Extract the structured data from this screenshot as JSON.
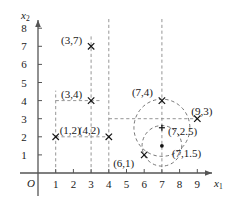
{
  "chart_data": {
    "type": "scatter",
    "title": "",
    "xlabel": "x1",
    "ylabel": "x2",
    "xlim": [
      0,
      9.9
    ],
    "ylim": [
      0,
      8.7
    ],
    "grid": "dashed-guides",
    "legend": "none",
    "axis_labels": {
      "x": "x",
      "x_sub": "1",
      "y": "x",
      "y_sub": "2",
      "origin": "O"
    },
    "xticks": [
      "1",
      "2",
      "3",
      "4",
      "5",
      "6",
      "7",
      "8",
      "9"
    ],
    "xtick_values": [
      1,
      2,
      3,
      4,
      5,
      6,
      7,
      8,
      9
    ],
    "yticks": [
      "1",
      "2",
      "3",
      "4",
      "5",
      "6",
      "7",
      "8"
    ],
    "ytick_values": [
      1,
      2,
      3,
      4,
      5,
      6,
      7,
      8
    ],
    "points": [
      {
        "id": "p37",
        "label": "(3,7)",
        "x": 3,
        "y": 7,
        "marker": "cross",
        "label_dx": -30,
        "label_dy": -11
      },
      {
        "id": "p34",
        "label": "(3,4)",
        "x": 3,
        "y": 4,
        "marker": "cross",
        "label_dx": -30,
        "label_dy": -12
      },
      {
        "id": "p12",
        "label": "(1,2)",
        "x": 1,
        "y": 2,
        "marker": "cross",
        "label_dx": 4,
        "label_dy": -12
      },
      {
        "id": "p42",
        "label": "(4,2)",
        "x": 4,
        "y": 2,
        "marker": "cross",
        "label_dx": -30,
        "label_dy": -12
      },
      {
        "id": "p61",
        "label": "(6,1)",
        "x": 6,
        "y": 1,
        "marker": "cross",
        "label_dx": -31,
        "label_dy": 3
      },
      {
        "id": "p74",
        "label": "(7,4)",
        "x": 7,
        "y": 4,
        "marker": "cross",
        "label_dx": -30,
        "label_dy": -14
      },
      {
        "id": "p93",
        "label": "(9,3)",
        "x": 9,
        "y": 3,
        "marker": "cross",
        "label_dx": -6,
        "label_dy": -13
      },
      {
        "id": "p725",
        "label": "(7,2.5)",
        "x": 7,
        "y": 2.5,
        "marker": "plus",
        "label_dx": 6,
        "label_dy": -2
      },
      {
        "id": "p715",
        "label": "(7,1.5)",
        "x": 7,
        "y": 1.5,
        "marker": "dot",
        "label_dx": 10,
        "label_dy": 2
      }
    ],
    "circles": [
      {
        "id": "outer-circle",
        "cx": 7,
        "cy": 2.5,
        "r": 1.58
      },
      {
        "id": "inner-circle",
        "cx": 7,
        "cy": 1.5,
        "r": 1.12
      }
    ],
    "guides_vertical": [
      1,
      3,
      4,
      7
    ],
    "guides_horizontal": [
      4,
      3,
      2
    ]
  }
}
